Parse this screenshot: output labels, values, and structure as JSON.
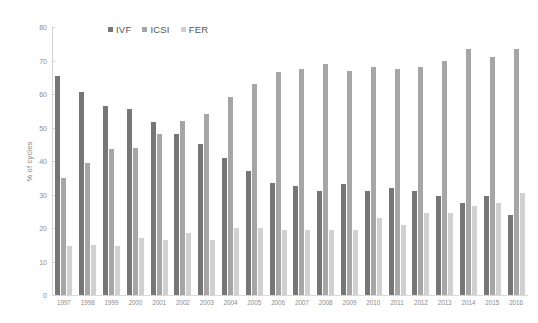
{
  "chart_data": {
    "type": "bar",
    "title": "",
    "xlabel": "",
    "ylabel": "% of cycles",
    "ylim": [
      0,
      80
    ],
    "ytick_step": 10,
    "yticks": [
      "80",
      "70",
      "60",
      "50",
      "40",
      "30",
      "20",
      "10",
      "0"
    ],
    "grid": false,
    "legend_position": "top-center",
    "categories": [
      "1997",
      "1998",
      "1999",
      "2000",
      "2001",
      "2002",
      "2003",
      "2004",
      "2005",
      "2006",
      "2007",
      "2008",
      "2009",
      "2010",
      "2011",
      "2012",
      "2013",
      "2014",
      "2015",
      "2016"
    ],
    "series": [
      {
        "name": "IVF",
        "color": "#767676",
        "values": [
          65.5,
          60.5,
          56.5,
          55.5,
          51.5,
          48.0,
          45.0,
          41.0,
          37.0,
          33.5,
          32.5,
          31.0,
          33.0,
          31.0,
          32.0,
          31.0,
          29.5,
          27.5,
          29.5,
          24.0
        ]
      },
      {
        "name": "ICSI",
        "color": "#a6a6a6",
        "values": [
          35.0,
          39.5,
          43.5,
          44.0,
          48.0,
          52.0,
          54.0,
          59.0,
          63.0,
          66.5,
          67.5,
          69.0,
          67.0,
          68.0,
          67.5,
          68.0,
          70.0,
          73.5,
          71.0,
          73.5
        ]
      },
      {
        "name": "FER",
        "color": "#d0d0d0",
        "values": [
          14.5,
          15.0,
          14.5,
          17.0,
          16.5,
          18.5,
          16.5,
          20.0,
          20.0,
          19.5,
          19.5,
          19.5,
          19.5,
          23.0,
          21.0,
          24.5,
          24.5,
          26.5,
          27.5,
          30.5
        ]
      }
    ]
  },
  "legend": {
    "items": [
      {
        "label": "IVF",
        "swatch_class": "ivf",
        "swatch_name": "legend-swatch-ivf"
      },
      {
        "label": "ICSI",
        "swatch_class": "icsi",
        "swatch_name": "legend-swatch-icsi"
      },
      {
        "label": "FER",
        "swatch_class": "fer",
        "swatch_name": "legend-swatch-fer"
      }
    ]
  },
  "axis": {
    "y_title": "% of cycles"
  },
  "colors": {
    "ivf": "#767676",
    "icsi": "#a6a6a6",
    "fer": "#d0d0d0",
    "axis": "#d4d4d4",
    "tick_text": "#8c8c8c",
    "background": "#ffffff"
  }
}
